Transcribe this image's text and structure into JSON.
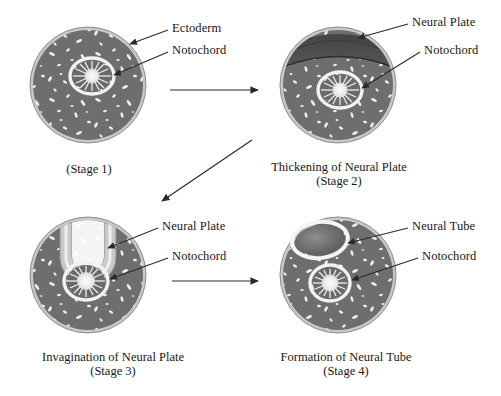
{
  "figure": {
    "background": "#ffffff",
    "palette": {
      "ink": "#171717",
      "ectoderm_rim": "#c9c9c9",
      "mesoderm_fill": "#6e6e6e",
      "neural_plate_dark": "#4a4a4a",
      "speckle": "#efefef",
      "notochord_center": "#f4f4f4",
      "arrow": "#2a2a2a"
    }
  },
  "panels": [
    {
      "id": "stage-1",
      "caption_line1": "",
      "caption_line2": "(Stage 1)",
      "labels": [
        {
          "id": "ectoderm",
          "text": "Ectoderm"
        },
        {
          "id": "notochord",
          "text": "Notochord"
        }
      ]
    },
    {
      "id": "stage-2",
      "caption_line1": "Thickening of Neural Plate",
      "caption_line2": "(Stage 2)",
      "labels": [
        {
          "id": "neural-plate",
          "text": "Neural Plate"
        },
        {
          "id": "notochord",
          "text": "Notochord"
        }
      ]
    },
    {
      "id": "stage-3",
      "caption_line1": "Invagination of Neural Plate",
      "caption_line2": "(Stage 3)",
      "labels": [
        {
          "id": "neural-plate",
          "text": "Neural Plate"
        },
        {
          "id": "notochord",
          "text": "Notochord"
        }
      ]
    },
    {
      "id": "stage-4",
      "caption_line1": "Formation of Neural Tube",
      "caption_line2": "(Stage 4)",
      "labels": [
        {
          "id": "neural-tube",
          "text": "Neural Tube"
        },
        {
          "id": "notochord",
          "text": "Notochord"
        }
      ]
    }
  ],
  "flow_arrows": [
    {
      "id": "arrow-stage1-to-stage2",
      "direction": "right"
    },
    {
      "id": "arrow-stage2-to-stage3",
      "direction": "down-left"
    },
    {
      "id": "arrow-stage3-to-stage4",
      "direction": "right"
    }
  ]
}
